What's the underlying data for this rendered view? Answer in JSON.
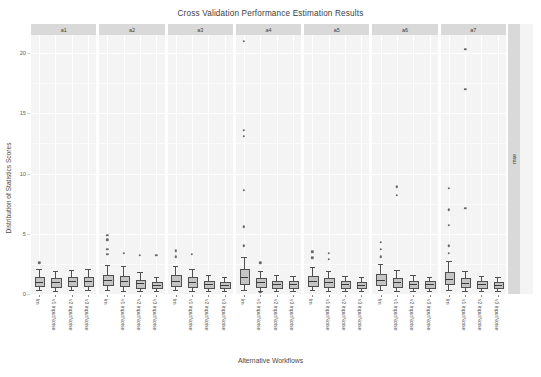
{
  "chart_data": {
    "type": "box",
    "title": "Cross Validation Performance Estimation Results",
    "xlabel": "Alternative Workflows",
    "ylabel": "Distribution of Statistics Scores",
    "ylim": [
      0,
      21.5
    ],
    "yticks": [
      0,
      5,
      10,
      15,
      20
    ],
    "ytick_labels": [
      "0",
      "5",
      "10",
      "15",
      "20"
    ],
    "grid": true,
    "legend": "none",
    "facet_row_label": "mse",
    "facet_col_labels": [
      "a1",
      "a2",
      "a3",
      "a4",
      "a5",
      "a6",
      "a7"
    ],
    "categories": [
      "lm",
      "v1 inputNoise",
      "v2 inputNoise",
      "v3 inputNoise"
    ],
    "panels": [
      {
        "name": "a1",
        "boxes": [
          {
            "category": "lm",
            "min": 0.3,
            "q1": 0.72,
            "median": 1.02,
            "q3": 1.38,
            "max": 2.05,
            "outliers": [
              2.6
            ]
          },
          {
            "category": "v1 inputNoise",
            "min": 0.28,
            "q1": 0.7,
            "median": 0.98,
            "q3": 1.32,
            "max": 1.95,
            "outliers": []
          },
          {
            "category": "v2 inputNoise",
            "min": 0.3,
            "q1": 0.74,
            "median": 1.05,
            "q3": 1.4,
            "max": 2.0,
            "outliers": []
          },
          {
            "category": "v3 inputNoise",
            "min": 0.32,
            "q1": 0.78,
            "median": 1.08,
            "q3": 1.45,
            "max": 2.1,
            "outliers": []
          }
        ]
      },
      {
        "name": "a2",
        "boxes": [
          {
            "category": "lm",
            "min": 0.3,
            "q1": 0.8,
            "median": 1.15,
            "q3": 1.6,
            "max": 2.4,
            "outliers": [
              3.3,
              3.7,
              4.5,
              4.9
            ]
          },
          {
            "category": "v1 inputNoise",
            "min": 0.28,
            "q1": 0.72,
            "median": 1.05,
            "q3": 1.5,
            "max": 2.3,
            "outliers": [
              3.4
            ]
          },
          {
            "category": "v2 inputNoise",
            "min": 0.26,
            "q1": 0.62,
            "median": 0.88,
            "q3": 1.2,
            "max": 1.8,
            "outliers": [
              3.2
            ]
          },
          {
            "category": "v3 inputNoise",
            "min": 0.24,
            "q1": 0.55,
            "median": 0.78,
            "q3": 1.02,
            "max": 1.45,
            "outliers": [
              3.2
            ]
          }
        ]
      },
      {
        "name": "a3",
        "boxes": [
          {
            "category": "lm",
            "min": 0.3,
            "q1": 0.78,
            "median": 1.1,
            "q3": 1.55,
            "max": 2.35,
            "outliers": [
              3.1,
              3.6
            ]
          },
          {
            "category": "v1 inputNoise",
            "min": 0.28,
            "q1": 0.7,
            "median": 1.0,
            "q3": 1.4,
            "max": 2.1,
            "outliers": [
              3.3
            ]
          },
          {
            "category": "v2 inputNoise",
            "min": 0.25,
            "q1": 0.58,
            "median": 0.82,
            "q3": 1.1,
            "max": 1.55,
            "outliers": []
          },
          {
            "category": "v3 inputNoise",
            "min": 0.24,
            "q1": 0.54,
            "median": 0.76,
            "q3": 1.0,
            "max": 1.4,
            "outliers": []
          }
        ]
      },
      {
        "name": "a4",
        "boxes": [
          {
            "category": "lm",
            "min": 0.35,
            "q1": 0.95,
            "median": 1.4,
            "q3": 2.1,
            "max": 3.1,
            "outliers": [
              4.0,
              5.6,
              8.6,
              13.1,
              13.6,
              21.0
            ]
          },
          {
            "category": "v1 inputNoise",
            "min": 0.28,
            "q1": 0.7,
            "median": 1.0,
            "q3": 1.35,
            "max": 1.95,
            "outliers": [
              2.6,
              0.15
            ]
          },
          {
            "category": "v2 inputNoise",
            "min": 0.26,
            "q1": 0.6,
            "median": 0.85,
            "q3": 1.12,
            "max": 1.6,
            "outliers": []
          },
          {
            "category": "v3 inputNoise",
            "min": 0.25,
            "q1": 0.56,
            "median": 0.8,
            "q3": 1.05,
            "max": 1.5,
            "outliers": []
          }
        ]
      },
      {
        "name": "a5",
        "boxes": [
          {
            "category": "lm",
            "min": 0.3,
            "q1": 0.76,
            "median": 1.08,
            "q3": 1.5,
            "max": 2.25,
            "outliers": [
              3.0,
              3.5
            ]
          },
          {
            "category": "v1 inputNoise",
            "min": 0.28,
            "q1": 0.68,
            "median": 0.98,
            "q3": 1.32,
            "max": 1.95,
            "outliers": [
              2.9,
              3.4
            ]
          },
          {
            "category": "v2 inputNoise",
            "min": 0.25,
            "q1": 0.58,
            "median": 0.82,
            "q3": 1.08,
            "max": 1.5,
            "outliers": []
          },
          {
            "category": "v3 inputNoise",
            "min": 0.24,
            "q1": 0.54,
            "median": 0.78,
            "q3": 1.02,
            "max": 1.42,
            "outliers": []
          }
        ]
      },
      {
        "name": "a6",
        "boxes": [
          {
            "category": "lm",
            "min": 0.3,
            "q1": 0.82,
            "median": 1.18,
            "q3": 1.65,
            "max": 2.5,
            "outliers": [
              3.1,
              3.7,
              4.3
            ]
          },
          {
            "category": "v1 inputNoise",
            "min": 0.28,
            "q1": 0.68,
            "median": 0.98,
            "q3": 1.35,
            "max": 2.0,
            "outliers": [
              8.2,
              8.9
            ]
          },
          {
            "category": "v2 inputNoise",
            "min": 0.25,
            "q1": 0.58,
            "median": 0.84,
            "q3": 1.1,
            "max": 1.55,
            "outliers": []
          },
          {
            "category": "v3 inputNoise",
            "min": 0.24,
            "q1": 0.55,
            "median": 0.8,
            "q3": 1.04,
            "max": 1.45,
            "outliers": []
          }
        ]
      },
      {
        "name": "a7",
        "boxes": [
          {
            "category": "lm",
            "min": 0.32,
            "q1": 0.88,
            "median": 1.25,
            "q3": 1.8,
            "max": 2.7,
            "outliers": [
              3.4,
              4.0,
              5.7,
              7.0,
              8.8
            ]
          },
          {
            "category": "v1 inputNoise",
            "min": 0.28,
            "q1": 0.66,
            "median": 0.95,
            "q3": 1.3,
            "max": 1.9,
            "outliers": [
              7.1,
              17.0,
              20.3
            ]
          },
          {
            "category": "v2 inputNoise",
            "min": 0.25,
            "q1": 0.58,
            "median": 0.82,
            "q3": 1.08,
            "max": 1.52,
            "outliers": []
          },
          {
            "category": "v3 inputNoise",
            "min": 0.24,
            "q1": 0.54,
            "median": 0.78,
            "q3": 1.0,
            "max": 1.4,
            "outliers": []
          }
        ]
      }
    ]
  }
}
